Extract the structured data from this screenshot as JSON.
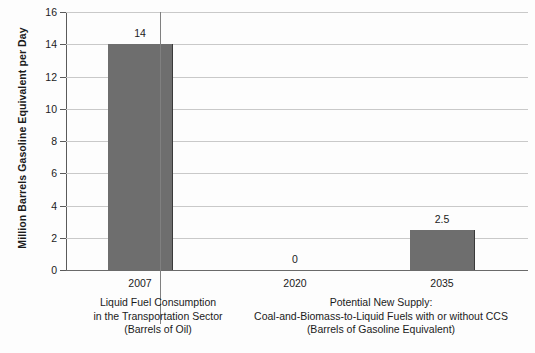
{
  "chart_data": {
    "type": "bar",
    "title": "",
    "xlabel": "",
    "ylabel": "Million Barrels Gasoline Equivalent per Day",
    "ylim": [
      0,
      16
    ],
    "yticks": [
      0,
      2,
      4,
      6,
      8,
      10,
      12,
      14,
      16
    ],
    "ytick_labels": [
      "0",
      "2",
      "4",
      "6",
      "8",
      "10",
      "12",
      "14",
      "16"
    ],
    "grid": true,
    "legend": "none",
    "categories": [
      "2007",
      "2020",
      "2035"
    ],
    "values": [
      14,
      0,
      2.5
    ],
    "data_labels": [
      "14",
      "0",
      "2.5"
    ],
    "bar_color": "#6e6e6e",
    "gridline_color": "#c9c9c9",
    "axis_color": "#5a5a5a",
    "groups": [
      {
        "categories": [
          "2007"
        ],
        "caption_lines": [
          "Liquid Fuel Consumption",
          "in the Transportation Sector",
          "(Barrels of Oil)"
        ]
      },
      {
        "categories": [
          "2020",
          "2035"
        ],
        "caption_lines": [
          "Potential New Supply:",
          "Coal-and-Biomass-to-Liquid Fuels with or without CCS",
          "(Barrels of Gasoline Equivalent)"
        ]
      }
    ]
  }
}
